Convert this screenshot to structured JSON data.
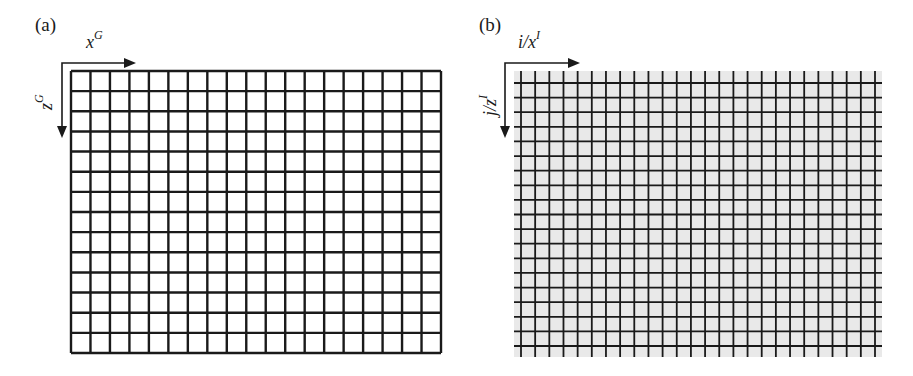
{
  "figure": {
    "panels": [
      {
        "id": "a",
        "label": "(a)",
        "description": "Regular grid in global coordinates",
        "x_axis": {
          "symbol": "x",
          "superscript": "G"
        },
        "z_axis": {
          "symbol": "z",
          "superscript": "G"
        },
        "grid": {
          "columns": 19,
          "rows": 14,
          "background": "#ffffff",
          "line_color": "#1a1a1a"
        }
      },
      {
        "id": "b",
        "label": "(b)",
        "description": "Image pixel grid in image coordinates",
        "x_axis": {
          "symbol": "i/x",
          "superscript": "I"
        },
        "z_axis": {
          "symbol": "j/z",
          "superscript": "I"
        },
        "grid": {
          "vertical_lines": 26,
          "horizontal_lines": 19,
          "background": "#e9e9e9",
          "line_color": "#1a1a1a"
        }
      }
    ]
  }
}
